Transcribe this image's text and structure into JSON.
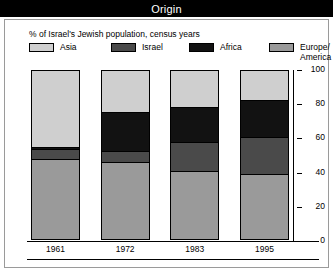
{
  "window": {
    "title": "Origin"
  },
  "chart_data": {
    "type": "bar",
    "subtype": "stacked-bar-100",
    "title": "Origin",
    "subtitle": "% of Israel's Jewish population, census years",
    "xlabel": "",
    "ylabel": "",
    "ylim": [
      0,
      100
    ],
    "yticks": [
      0,
      20,
      40,
      60,
      80,
      100
    ],
    "grid": false,
    "legend_position": "top",
    "stack_order_bottom_to_top": [
      "Europe/America",
      "Israel",
      "Africa",
      "Asia"
    ],
    "categories": [
      "1961",
      "1972",
      "1983",
      "1995"
    ],
    "series": [
      {
        "name": "Europe/America",
        "color": "#9a9a9a",
        "values": [
          47,
          45,
          40,
          38
        ]
      },
      {
        "name": "Israel",
        "color": "#4a4a4a",
        "values": [
          6,
          7,
          17,
          22
        ]
      },
      {
        "name": "Africa",
        "color": "#121212",
        "values": [
          1,
          23,
          21,
          22
        ]
      },
      {
        "name": "Asia",
        "color": "#cfcfcf",
        "values": [
          46,
          25,
          22,
          18
        ]
      }
    ]
  },
  "legend": {
    "items": [
      {
        "label": "Asia",
        "color": "#cfcfcf"
      },
      {
        "label": "Israel",
        "color": "#4a4a4a"
      },
      {
        "label": "Africa",
        "color": "#121212"
      },
      {
        "label": "Europe/\nAmerica",
        "color": "#9a9a9a"
      }
    ]
  },
  "axis": {
    "y_tick_labels": [
      "100",
      "80",
      "60",
      "40",
      "20",
      "0"
    ],
    "x_tick_labels": [
      "1961",
      "1972",
      "1983",
      "1995"
    ]
  }
}
